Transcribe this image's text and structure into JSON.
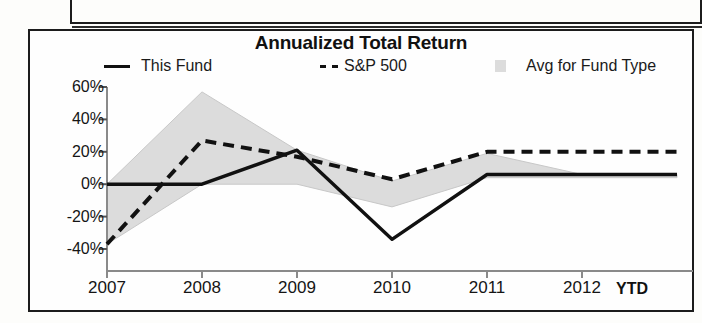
{
  "artifact": {
    "top_fragment_name": "page-box-fragment"
  },
  "chart": {
    "title": "Annualized Total Return",
    "legend": [
      {
        "label": "This Fund",
        "marker": "solid-line-marker",
        "color": "#111111"
      },
      {
        "label": "S&P 500",
        "marker": "dashed-line-marker",
        "color": "#111111"
      },
      {
        "label": "Avg for Fund Type",
        "marker": "gray-area-swatch",
        "color": "#dcdcdc"
      }
    ],
    "ytd_suffix": "YTD"
  },
  "chart_data": {
    "type": "line",
    "title": "Annualized Total Return",
    "xlabel": "",
    "ylabel": "",
    "categories": [
      "2007",
      "2008",
      "2009",
      "2010",
      "2011",
      "2012"
    ],
    "x_tick_labels": [
      "2007",
      "2008",
      "2009",
      "2010",
      "2011",
      "2012"
    ],
    "y_tick_labels": [
      "60%",
      "40%",
      "20%",
      "0%",
      "-20%",
      "-40%"
    ],
    "y_ticks": [
      60,
      40,
      20,
      0,
      -20,
      -40
    ],
    "ylim": [
      -40,
      60
    ],
    "grid": false,
    "legend_position": "top",
    "series": [
      {
        "name": "This Fund",
        "style": "solid",
        "color": "#111111",
        "values": [
          0,
          0,
          21,
          -34,
          6,
          6
        ]
      },
      {
        "name": "S&P 500",
        "style": "dashed",
        "color": "#111111",
        "values": [
          -37,
          27,
          17,
          3,
          20,
          20
        ]
      },
      {
        "name": "Avg for Fund Type",
        "style": "band",
        "color": "#dcdcdc",
        "upper": [
          0,
          57,
          21,
          2,
          19,
          6
        ],
        "lower": [
          -37,
          0,
          0,
          -14,
          4,
          4
        ]
      }
    ],
    "annotations": [
      "YTD"
    ]
  }
}
